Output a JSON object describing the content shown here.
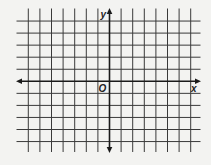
{
  "diagram": {
    "type": "coordinate-plane",
    "labels": {
      "x_axis": "x",
      "y_axis": "y",
      "origin": "O"
    },
    "grid": {
      "vertical_line_count": 15,
      "horizontal_line_count": 11,
      "y_axis_index": 7,
      "x_axis_index": 5,
      "x_units_left_of_origin": 7,
      "x_units_right_of_origin": 7,
      "y_units_above_origin": 5,
      "y_units_below_origin": 5
    },
    "colors": {
      "background": "#f3f3f1",
      "grid_line": "#3a3a3a",
      "axis": "#1a1a1a",
      "label": "#222222"
    }
  }
}
